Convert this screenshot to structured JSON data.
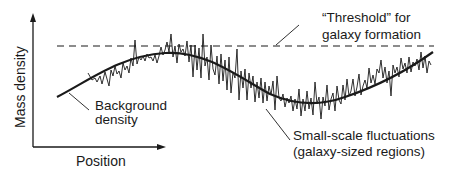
{
  "diagram": {
    "axes": {
      "y_label": "Mass density",
      "x_label": "Position"
    },
    "threshold": {
      "line1": "“Threshold” for",
      "line2": "galaxy formation"
    },
    "background": {
      "line1": "Background",
      "line2": "density"
    },
    "fluctuations": {
      "line1": "Small-scale fluctuations",
      "line2": "(galaxy-sized regions)"
    },
    "colors": {
      "ink": "#1a1a1a",
      "background": "#ffffff"
    }
  }
}
